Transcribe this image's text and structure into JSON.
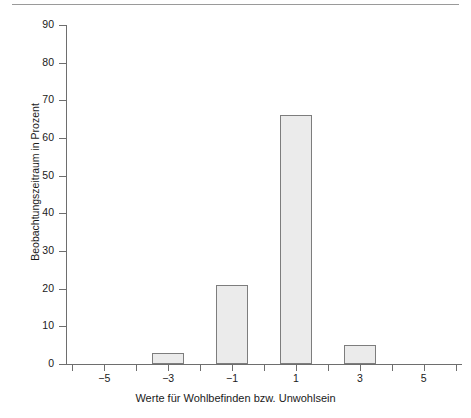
{
  "chart_data": {
    "type": "bar",
    "title": "",
    "subtitle": "",
    "xlabel": "Werte für Wohlbefinden bzw. Unwohlsein",
    "ylabel": "Beobachtungszeitraum in Prozent",
    "categories": [
      -5,
      -4,
      -3,
      -2,
      -1,
      0,
      1,
      2,
      3,
      4,
      5
    ],
    "values": [
      0,
      0,
      3,
      0,
      21,
      0,
      66,
      0,
      5,
      0,
      0
    ],
    "bars": [
      {
        "x": -3,
        "value": 3
      },
      {
        "x": -1,
        "value": 21
      },
      {
        "x": 1,
        "value": 66
      },
      {
        "x": 3,
        "value": 5
      }
    ],
    "xlim": [
      -6.2,
      6.2
    ],
    "ylim": [
      0,
      90
    ],
    "ytick_values": [
      0,
      10,
      20,
      30,
      40,
      50,
      60,
      70,
      80,
      90
    ],
    "ytick_labels": [
      "0",
      "10",
      "20",
      "30",
      "40",
      "50",
      "60",
      "70",
      "80",
      "90"
    ],
    "xtick_values": [
      -6,
      -5,
      -4,
      -3,
      -2,
      -1,
      0,
      1,
      2,
      3,
      4,
      5,
      6
    ],
    "xtick_labeled": [
      {
        "value": -5,
        "label": "−5"
      },
      {
        "value": -3,
        "label": "−3"
      },
      {
        "value": -1,
        "label": "−1"
      },
      {
        "value": 1,
        "label": "1"
      },
      {
        "value": 3,
        "label": "3"
      },
      {
        "value": 5,
        "label": "5"
      }
    ],
    "grid": false,
    "legend": null,
    "bar_fill_color": "#ebebeb",
    "bar_edge_color": "#7d7d7d",
    "axis_color": "#6e6e6e"
  }
}
